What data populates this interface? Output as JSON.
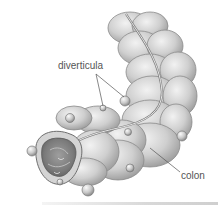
{
  "figure": {
    "style": "grayscale anatomical illustration",
    "labels": {
      "diverticula": "diverticula",
      "colon": "colon"
    },
    "colors": {
      "background": "#ffffff",
      "tissue_light": "#e6e6e6",
      "tissue_mid": "#bdbdbd",
      "tissue_dark": "#8a8a8a",
      "outline": "#6e6e6e",
      "leader_line": "#555555",
      "label_text": "#555555"
    }
  }
}
